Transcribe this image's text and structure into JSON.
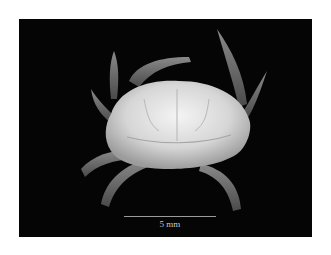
{
  "figure": {
    "background_color": "#050505",
    "page_color": "#ffffff",
    "scale_bar": {
      "label": "5 mm",
      "color": "#9a9a9a"
    }
  }
}
